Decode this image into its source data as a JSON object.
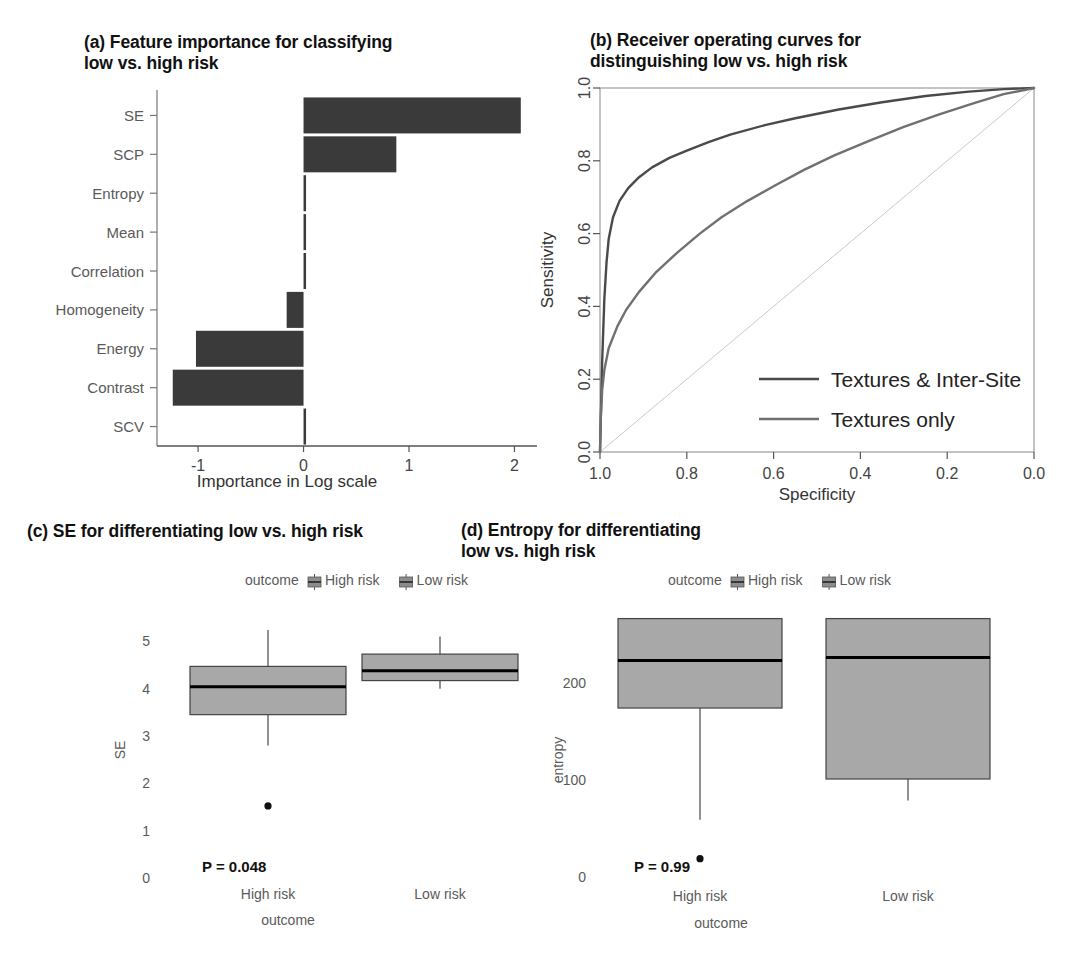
{
  "figure": {
    "panels": [
      "a",
      "b",
      "c",
      "d"
    ]
  },
  "panel_a": {
    "title_line1": "(a) Feature importance for classifying",
    "title_line2": "low vs. high risk",
    "chart_data": {
      "type": "bar",
      "orientation": "horizontal",
      "title": "(a) Feature importance for classifying low vs. high risk",
      "xlabel": "Importance in Log scale",
      "ylabel": "",
      "categories": [
        "SE",
        "SCP",
        "Entropy",
        "Mean",
        "Correlation",
        "Homogeneity",
        "Energy",
        "Contrast",
        "SCV"
      ],
      "values": [
        2.06,
        0.88,
        0.0,
        0.0,
        0.0,
        -0.16,
        -1.02,
        -1.24,
        0.0
      ],
      "xlim": [
        -1.38,
        2.1
      ],
      "xticks": [
        -1,
        0,
        1,
        2
      ],
      "xticklabels": [
        "-1",
        "0",
        "1",
        "2"
      ],
      "grid": false,
      "bar_color": "#3a3a3a"
    }
  },
  "panel_b": {
    "title_line1": "(b) Receiver operating curves for",
    "title_line2": "distinguishing low vs. high risk",
    "chart_data": {
      "type": "line",
      "title": "(b) Receiver operating curves for distinguishing low vs. high risk",
      "xlabel": "Specificity",
      "ylabel": "Sensitivity",
      "xlim": [
        1.0,
        0.0
      ],
      "ylim": [
        0.0,
        1.0
      ],
      "xticks": [
        1.0,
        0.8,
        0.6,
        0.4,
        0.2,
        0.0
      ],
      "xticklabels": [
        "1.0",
        "0.8",
        "0.6",
        "0.4",
        "0.2",
        "0.0"
      ],
      "yticks": [
        0.0,
        0.2,
        0.4,
        0.6,
        0.8,
        1.0
      ],
      "yticklabels": [
        "0.0",
        "0.2",
        "0.4",
        "0.6",
        "0.8",
        "1.0"
      ],
      "grid": false,
      "legend_position": "bottom-right",
      "series": [
        {
          "name": "Textures & Inter-Site",
          "color": "#4a4a4a",
          "points": [
            [
              1.0,
              0.0
            ],
            [
              0.995,
              0.25
            ],
            [
              0.99,
              0.42
            ],
            [
              0.985,
              0.52
            ],
            [
              0.98,
              0.585
            ],
            [
              0.97,
              0.645
            ],
            [
              0.955,
              0.69
            ],
            [
              0.935,
              0.725
            ],
            [
              0.91,
              0.755
            ],
            [
              0.88,
              0.782
            ],
            [
              0.84,
              0.808
            ],
            [
              0.8,
              0.828
            ],
            [
              0.75,
              0.851
            ],
            [
              0.7,
              0.872
            ],
            [
              0.62,
              0.898
            ],
            [
              0.55,
              0.917
            ],
            [
              0.45,
              0.941
            ],
            [
              0.35,
              0.961
            ],
            [
              0.25,
              0.978
            ],
            [
              0.15,
              0.99
            ],
            [
              0.07,
              0.997
            ],
            [
              0.0,
              1.0
            ]
          ]
        },
        {
          "name": "Textures only",
          "color": "#707070",
          "points": [
            [
              1.0,
              0.0
            ],
            [
              0.998,
              0.1
            ],
            [
              0.995,
              0.17
            ],
            [
              0.99,
              0.225
            ],
            [
              0.98,
              0.285
            ],
            [
              0.96,
              0.345
            ],
            [
              0.94,
              0.39
            ],
            [
              0.91,
              0.44
            ],
            [
              0.87,
              0.495
            ],
            [
              0.82,
              0.55
            ],
            [
              0.77,
              0.6
            ],
            [
              0.72,
              0.645
            ],
            [
              0.66,
              0.69
            ],
            [
              0.6,
              0.73
            ],
            [
              0.53,
              0.775
            ],
            [
              0.46,
              0.815
            ],
            [
              0.38,
              0.855
            ],
            [
              0.3,
              0.893
            ],
            [
              0.22,
              0.927
            ],
            [
              0.14,
              0.958
            ],
            [
              0.07,
              0.983
            ],
            [
              0.0,
              1.0
            ]
          ]
        }
      ],
      "reference_line": {
        "name": "chance diagonal",
        "color": "#c9c9c9",
        "from": [
          1.0,
          0.0
        ],
        "to": [
          0.0,
          1.0
        ]
      }
    },
    "legend": [
      {
        "label": "Textures & Inter-Site",
        "color": "#4a4a4a"
      },
      {
        "label": "Textures only",
        "color": "#707070"
      }
    ]
  },
  "panel_c": {
    "title": "(c) SE for differentiating low vs. high risk",
    "legend_title": "outcome",
    "legend_items": [
      "High risk",
      "Low risk"
    ],
    "pvalue": "P = 0.048",
    "chart_data": {
      "type": "boxplot",
      "title": "(c) SE for differentiating low vs. high risk",
      "xlabel": "outcome",
      "ylabel": "SE",
      "ylim": [
        -0.15,
        5.6
      ],
      "yticks": [
        0,
        1,
        2,
        3,
        4,
        5
      ],
      "yticklabels": [
        "0",
        "1",
        "2",
        "3",
        "4",
        "5"
      ],
      "categories": [
        "High risk",
        "Low risk"
      ],
      "grid": false,
      "box_fill": "#a8a8a8",
      "boxes": [
        {
          "category": "High risk",
          "whisker_low": 2.78,
          "q1": 3.43,
          "median": 4.02,
          "q3": 4.45,
          "whisker_high": 5.22,
          "outliers": [
            1.5
          ]
        },
        {
          "category": "Low risk",
          "whisker_low": 3.98,
          "q1": 4.15,
          "median": 4.36,
          "q3": 4.71,
          "whisker_high": 5.08,
          "outliers": []
        }
      ]
    }
  },
  "panel_d": {
    "title_line1": "(d) Entropy for differentiating",
    "title_line2": "low vs. high risk",
    "legend_title": "outcome",
    "legend_items": [
      "High risk",
      "Low risk"
    ],
    "pvalue": "P = 0.99",
    "chart_data": {
      "type": "boxplot",
      "title": "(d) Entropy for differentiating low vs. high risk",
      "xlabel": "outcome",
      "ylabel": "entropy",
      "ylim": [
        -8,
        280
      ],
      "yticks": [
        0,
        100,
        200
      ],
      "yticklabels": [
        "0",
        "100",
        "200"
      ],
      "categories": [
        "High risk",
        "Low risk"
      ],
      "grid": false,
      "box_fill": "#a8a8a8",
      "boxes": [
        {
          "category": "High risk",
          "whisker_low": 58,
          "q1": 173,
          "median": 222,
          "q3": 265,
          "whisker_high": 265,
          "outliers": [
            18
          ]
        },
        {
          "category": "Low risk",
          "whisker_low": 78,
          "q1": 100,
          "median": 225,
          "q3": 265,
          "whisker_high": 265,
          "outliers": []
        }
      ]
    }
  }
}
